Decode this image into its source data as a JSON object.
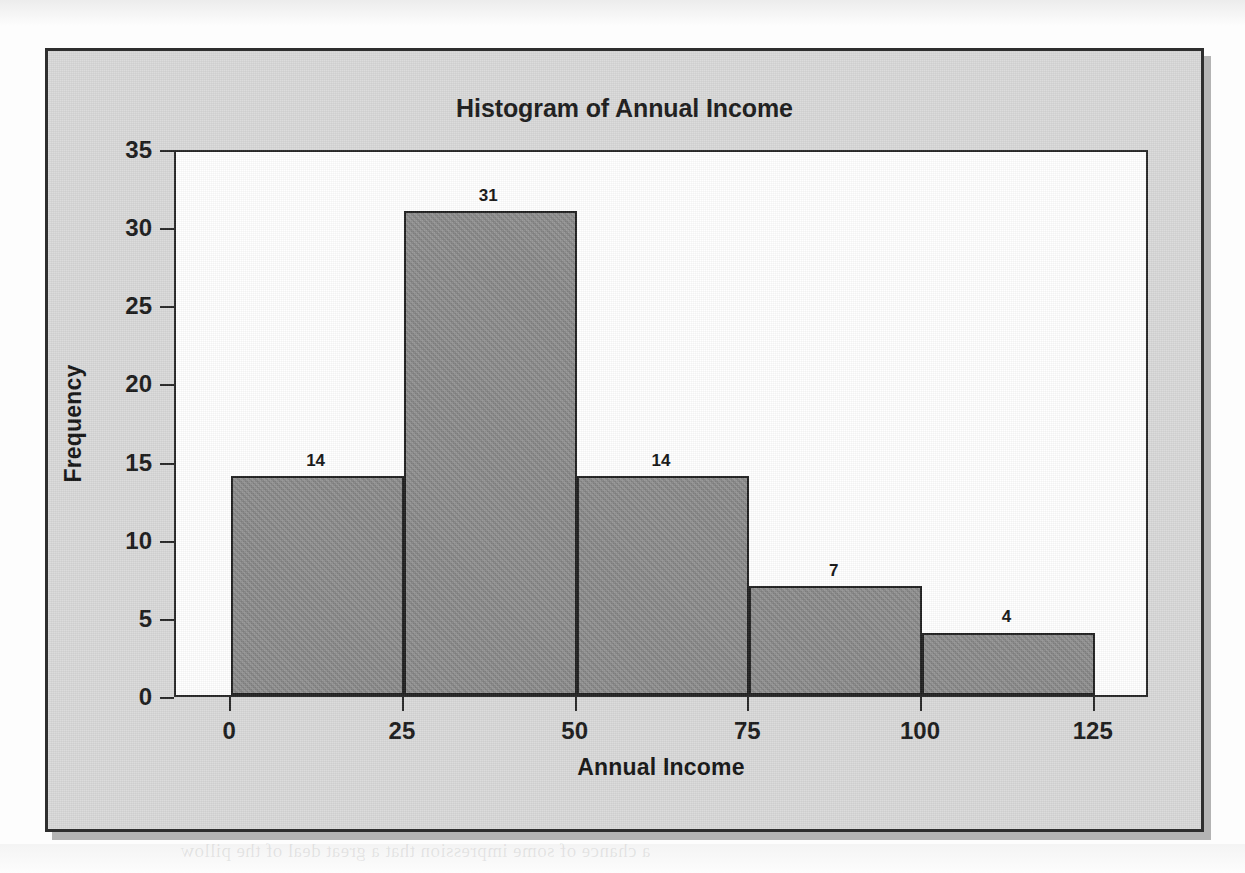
{
  "chart_data": {
    "type": "bar",
    "title": "Histogram of Annual Income",
    "xlabel": "Annual Income",
    "ylabel": "Frequency",
    "categories": [
      "0-25",
      "25-50",
      "50-75",
      "75-100",
      "100-125"
    ],
    "bin_edges": [
      0,
      25,
      50,
      75,
      100,
      125
    ],
    "values": [
      14,
      31,
      14,
      7,
      4
    ],
    "bar_labels": [
      "14",
      "31",
      "14",
      "7",
      "4"
    ],
    "xlim": [
      -8,
      133
    ],
    "ylim": [
      0,
      35
    ],
    "x_ticks": [
      "0",
      "25",
      "50",
      "75",
      "100",
      "125"
    ],
    "x_tick_values": [
      0,
      25,
      50,
      75,
      100,
      125
    ],
    "y_ticks": [
      "0",
      "5",
      "10",
      "15",
      "20",
      "25",
      "30",
      "35"
    ],
    "y_tick_values": [
      0,
      5,
      10,
      15,
      20,
      25,
      30,
      35
    ],
    "grid": false,
    "legend": null,
    "colors": {
      "bar_fill": "#8b8b8b",
      "bar_edge": "#1f1f1f",
      "plot_background": "#ffffff",
      "panel_background": "#d9d9d9",
      "frame_border": "#2e2e2e",
      "text": "#1a1a1a"
    }
  },
  "page": {
    "bleed_text": "a chance of some impression that a great deal of the pillow"
  }
}
